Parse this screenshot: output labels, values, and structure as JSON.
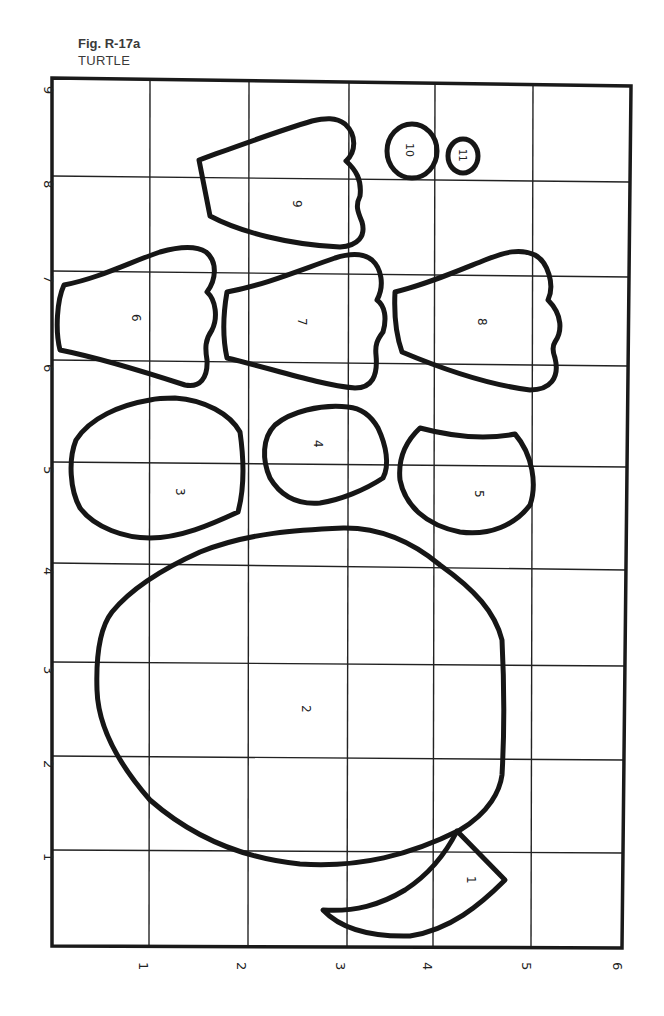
{
  "caption": {
    "figure": "Fig. R-17a",
    "title": "TURTLE"
  },
  "grid": {
    "left_axis_labels": [
      "9",
      "8",
      "7",
      "6",
      "5",
      "4",
      "3",
      "2",
      "1"
    ],
    "bottom_axis_labels": [
      "1",
      "2",
      "3",
      "4",
      "5",
      "6"
    ]
  },
  "pieces": [
    {
      "id": "piece-1",
      "label": "1",
      "part": "tail"
    },
    {
      "id": "piece-2",
      "label": "2",
      "part": "shell"
    },
    {
      "id": "piece-3",
      "label": "3",
      "part": "head"
    },
    {
      "id": "piece-4",
      "label": "4"
    },
    {
      "id": "piece-5",
      "label": "5"
    },
    {
      "id": "piece-6",
      "label": "6",
      "part": "leg"
    },
    {
      "id": "piece-7",
      "label": "7",
      "part": "leg"
    },
    {
      "id": "piece-8",
      "label": "8",
      "part": "leg"
    },
    {
      "id": "piece-9",
      "label": "9",
      "part": "leg"
    },
    {
      "id": "piece-10",
      "label": "10",
      "part": "eye"
    },
    {
      "id": "piece-11",
      "label": "11",
      "part": "pupil"
    }
  ],
  "colors": {
    "ink": "#161616",
    "paper": "#ffffff",
    "caption_text": "#3a3a3a"
  }
}
